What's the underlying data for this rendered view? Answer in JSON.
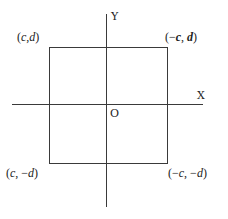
{
  "diagram": {
    "axes": {
      "x_label": "X",
      "y_label": "Y",
      "origin_label": "O"
    },
    "corners": {
      "top_left": {
        "open": "(",
        "a": "c",
        "sep": ",",
        "b": "d",
        "close": ")"
      },
      "top_right": {
        "open": "(−",
        "a": "c",
        "sep": ", ",
        "b": "d",
        "close": ")"
      },
      "bottom_left": {
        "open": "(",
        "a": "c",
        "sep": ", −",
        "b": "d",
        "close": ")"
      },
      "bottom_right": {
        "open": "(−",
        "a": "c",
        "sep": ", −",
        "b": "d",
        "close": ")"
      }
    },
    "colors": {
      "line": "#3a3a3a",
      "text": "#222222",
      "background": "#ffffff"
    }
  }
}
